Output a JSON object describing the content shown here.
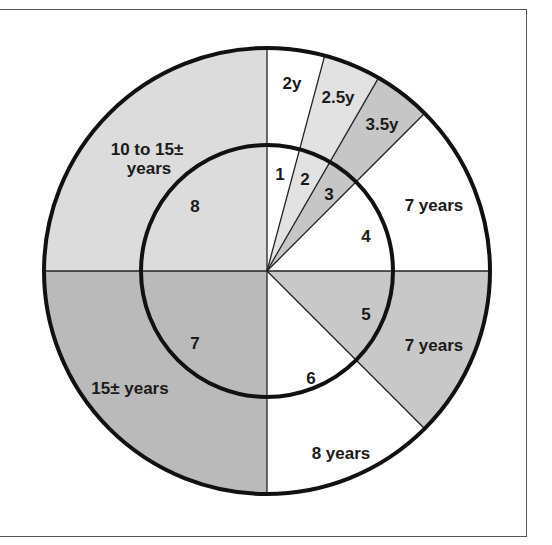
{
  "chart_data": {
    "type": "pie",
    "title": "",
    "center": [
      267,
      271
    ],
    "outer_radius": 223,
    "inner_radius": 126,
    "segments": [
      {
        "id": "1",
        "inner_label": "1",
        "outer_label": "2y",
        "start_deg": 0,
        "end_deg": 15,
        "fill": "#ffffff"
      },
      {
        "id": "2",
        "inner_label": "2",
        "outer_label": "2.5y",
        "start_deg": 15,
        "end_deg": 30,
        "fill": "#e2e2e2"
      },
      {
        "id": "3",
        "inner_label": "3",
        "outer_label": "3.5y",
        "start_deg": 30,
        "end_deg": 45,
        "fill": "#c6c6c6"
      },
      {
        "id": "4",
        "inner_label": "4",
        "outer_label": "7 years",
        "start_deg": 45,
        "end_deg": 90,
        "fill": "#ffffff"
      },
      {
        "id": "5",
        "inner_label": "5",
        "outer_label": "7 years",
        "start_deg": 90,
        "end_deg": 135,
        "fill": "#c8c8c8"
      },
      {
        "id": "6",
        "inner_label": "6",
        "outer_label": "8 years",
        "start_deg": 135,
        "end_deg": 180,
        "fill": "#ffffff"
      },
      {
        "id": "7",
        "inner_label": "7",
        "outer_label": "15± years",
        "start_deg": 180,
        "end_deg": 270,
        "fill": "#bababa"
      },
      {
        "id": "8",
        "inner_label": "8",
        "outer_label": "10 to 15± years",
        "start_deg": 270,
        "end_deg": 360,
        "fill": "#dcdcdc"
      }
    ],
    "values": [
      15,
      15,
      15,
      45,
      45,
      45,
      90,
      90
    ],
    "categories": [
      "1",
      "2",
      "3",
      "4",
      "5",
      "6",
      "7",
      "8"
    ]
  },
  "labels": {
    "outer": {
      "s1": "2y",
      "s2": "2.5y",
      "s3": "3.5y",
      "s4": "7 years",
      "s5": "7 years",
      "s6": "8 years",
      "s7": "15± years",
      "s8_line1": "10 to 15±",
      "s8_line2": "years"
    },
    "inner": {
      "s1": "1",
      "s2": "2",
      "s3": "3",
      "s4": "4",
      "s5": "5",
      "s6": "6",
      "s7": "7",
      "s8": "8"
    }
  }
}
